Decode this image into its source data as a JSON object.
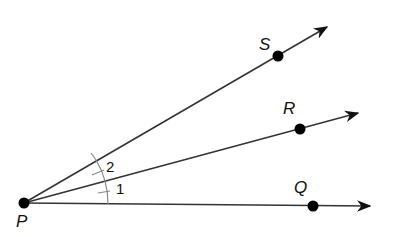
{
  "diagram": {
    "title": "",
    "vertex": {
      "label": "P",
      "x": 24,
      "y": 203
    },
    "rays": [
      {
        "label": "S",
        "dot": {
          "x": 278,
          "y": 56
        },
        "tip": {
          "x": 327,
          "y": 27
        },
        "label_pos": {
          "x": 259,
          "y": 50
        }
      },
      {
        "label": "R",
        "dot": {
          "x": 300,
          "y": 129
        },
        "tip": {
          "x": 358,
          "y": 113
        },
        "label_pos": {
          "x": 283,
          "y": 114
        }
      },
      {
        "label": "Q",
        "dot": {
          "x": 313,
          "y": 206
        },
        "tip": {
          "x": 370,
          "y": 206
        },
        "label_pos": {
          "x": 294,
          "y": 193
        }
      }
    ],
    "angles": [
      {
        "label": "1",
        "between": [
          "PQ",
          "PR"
        ],
        "label_pos": {
          "x": 118,
          "y": 195
        }
      },
      {
        "label": "2",
        "between": [
          "PR",
          "PS"
        ],
        "label_pos": {
          "x": 107,
          "y": 173
        }
      }
    ],
    "colors": {
      "line": "#333333",
      "point": "#000000"
    }
  }
}
